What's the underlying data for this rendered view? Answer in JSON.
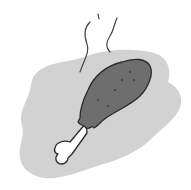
{
  "illustration": {
    "subject": "chicken drumstick",
    "colors": {
      "background": "#ffffff",
      "blob": "#d2d2d2",
      "meat": "#6e6e6e",
      "outline": "#2a2a2a",
      "bone": "#ffffff",
      "steam": "#444444",
      "speckle": "#3a3a3a"
    }
  }
}
